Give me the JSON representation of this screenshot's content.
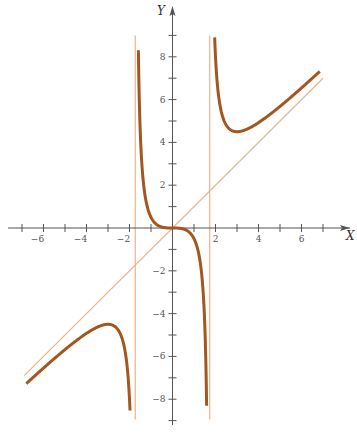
{
  "chart_data": {
    "type": "line",
    "title": "",
    "function": "y = x^3 / (x^2 - 3)",
    "xlabel": "X",
    "ylabel": "Y",
    "xlim": [
      -7.2,
      8.4
    ],
    "ylim": [
      -9.1,
      10.3
    ],
    "x_tick_labels": [
      "-6",
      "-4",
      "-2",
      "2",
      "4",
      "6"
    ],
    "x_ticks": [
      -7,
      -6,
      -5,
      -4,
      -3,
      -2,
      -1,
      1,
      2,
      3,
      4,
      5,
      6,
      7
    ],
    "y_tick_labels": [
      "8",
      "6",
      "4",
      "2",
      "-2",
      "-4",
      "-6",
      "-8"
    ],
    "y_ticks": [
      -9,
      -8,
      -7,
      -6,
      -5,
      -4,
      -3,
      -2,
      -1,
      1,
      2,
      3,
      4,
      5,
      6,
      7,
      8,
      9
    ],
    "grid": false,
    "legend": null,
    "asymptotes": {
      "vertical": [
        -1.732,
        1.732
      ],
      "oblique": "y = x"
    },
    "key_points": [
      {
        "x": -3,
        "y": -4.5,
        "label": "local max"
      },
      {
        "x": 0,
        "y": 0,
        "label": "inflection"
      },
      {
        "x": 3,
        "y": 4.5,
        "label": "local min"
      }
    ],
    "series": [
      {
        "name": "left branch",
        "x_range": [
          -6.8,
          -1.78
        ],
        "y_end": -8.9
      },
      {
        "name": "middle branch",
        "x_range": [
          -1.69,
          1.69
        ],
        "y_range": [
          9.0,
          -9.0
        ]
      },
      {
        "name": "right branch",
        "x_range": [
          1.78,
          6.85
        ],
        "y_start": 9.0
      }
    ],
    "colors": {
      "curve": "#a4561f",
      "asymptote": "#e9b48a",
      "axis": "#555555"
    }
  }
}
